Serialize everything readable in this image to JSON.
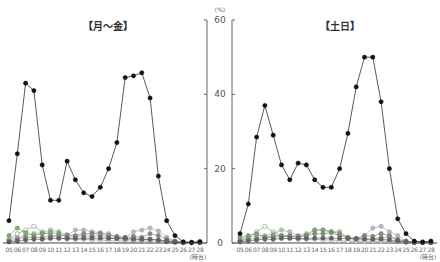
{
  "chart_data": [
    {
      "type": "line",
      "title": "【月～金】",
      "xlabel": "(時台)",
      "ylabel": "(%)",
      "ylim": [
        0,
        60
      ],
      "yticks": [
        0,
        20,
        40,
        60
      ],
      "grid": false,
      "categories": [
        "05",
        "06",
        "07",
        "08",
        "09",
        "10",
        "11",
        "12",
        "13",
        "14",
        "15",
        "16",
        "17",
        "18",
        "19",
        "20",
        "21",
        "22",
        "23",
        "24",
        "25",
        "26",
        "27",
        "28"
      ],
      "series": [
        {
          "name": "main",
          "color": "#111111",
          "fill": "#111111",
          "values": [
            6,
            24,
            43,
            41,
            21,
            11.5,
            11.5,
            22,
            17,
            13.5,
            12.5,
            15,
            20,
            27,
            44.5,
            45,
            45.8,
            39,
            18,
            6,
            2,
            0.3,
            0.2,
            0.4
          ]
        },
        {
          "name": "open-circle",
          "color": "#888888",
          "fill": "#ffffff",
          "values": [
            1,
            2.5,
            3.5,
            4.5,
            3,
            2,
            1.5,
            1,
            1,
            1,
            0.8,
            0.8,
            0.6,
            0.5,
            0.5,
            0.5,
            0.5,
            0.5,
            0.5,
            0.3,
            0.2,
            0.1,
            0.1,
            0.1
          ]
        },
        {
          "name": "light-gray",
          "color": "#999999",
          "fill": "#bbbbbb",
          "values": [
            1,
            1.5,
            2,
            2.5,
            2.8,
            3.5,
            3,
            2,
            3.5,
            3.5,
            3,
            2.8,
            2.5,
            1.5,
            1.5,
            3,
            3.5,
            4,
            3.2,
            1.5,
            0.5,
            0.2,
            0.1,
            0.1
          ]
        },
        {
          "name": "green",
          "color": "#5a9a4a",
          "fill": "#7ab06a",
          "values": [
            2,
            4,
            2.8,
            2,
            2.5,
            2.8,
            2.5,
            1.5,
            1.8,
            2,
            1.8,
            2,
            1.5,
            1.2,
            1,
            1.2,
            1,
            1,
            0.8,
            0.5,
            0.2,
            0.1,
            0.1,
            0.1
          ]
        },
        {
          "name": "mid-gray",
          "color": "#777777",
          "fill": "#8a8a8a",
          "values": [
            0.5,
            1,
            1.5,
            1.5,
            1.5,
            1.8,
            2,
            2.2,
            2,
            2.5,
            2.5,
            2.5,
            2,
            1.8,
            1.5,
            1.8,
            1.5,
            2.5,
            2,
            1,
            0.5,
            0.2,
            0.1,
            0.1
          ]
        },
        {
          "name": "dark-gray",
          "color": "#555555",
          "fill": "#666666",
          "values": [
            0.3,
            0.5,
            0.8,
            1,
            1,
            1.2,
            1.2,
            1.2,
            1.2,
            1.3,
            1.3,
            1.3,
            1.2,
            1.2,
            1.2,
            1,
            1,
            1,
            0.8,
            0.5,
            0.3,
            0.1,
            0.1,
            0.1
          ]
        }
      ]
    },
    {
      "type": "line",
      "title": "【土日】",
      "xlabel": "(時台)",
      "ylabel": "(%)",
      "ylim": [
        0,
        60
      ],
      "yticks": [
        0,
        20,
        40,
        60
      ],
      "grid": false,
      "categories": [
        "05",
        "06",
        "07",
        "08",
        "09",
        "10",
        "11",
        "12",
        "13",
        "14",
        "15",
        "16",
        "17",
        "18",
        "19",
        "20",
        "21",
        "22",
        "23",
        "24",
        "25",
        "26",
        "27",
        "28"
      ],
      "series": [
        {
          "name": "main",
          "color": "#111111",
          "fill": "#111111",
          "values": [
            2.5,
            10.5,
            28.5,
            37,
            29,
            21,
            17,
            21.5,
            21,
            17,
            15,
            15,
            20,
            29.5,
            42,
            50,
            50,
            38,
            20,
            6.5,
            2.5,
            0.5,
            0.3,
            0.5
          ]
        },
        {
          "name": "open-circle",
          "color": "#888888",
          "fill": "#ffffff",
          "values": [
            0.5,
            1.5,
            3,
            4.5,
            3,
            2,
            1.5,
            1,
            1,
            1,
            0.8,
            0.8,
            0.6,
            0.5,
            0.5,
            0.5,
            0.5,
            0.5,
            0.5,
            0.3,
            0.2,
            0.1,
            0.1,
            0.1
          ]
        },
        {
          "name": "light-gray",
          "color": "#999999",
          "fill": "#bbbbbb",
          "values": [
            1,
            1.5,
            2,
            2,
            2.5,
            3.5,
            3,
            2,
            2.5,
            3.5,
            3.5,
            3,
            3,
            1.5,
            1,
            2,
            4,
            4.5,
            3,
            2,
            0.5,
            0.2,
            0.1,
            0.1
          ]
        },
        {
          "name": "green",
          "color": "#5a9a4a",
          "fill": "#7ab06a",
          "values": [
            1.5,
            2,
            2.5,
            1.5,
            2,
            2,
            1.8,
            1.5,
            2,
            3.5,
            3.5,
            3,
            2.5,
            1.2,
            1,
            1.2,
            1,
            1.5,
            1.5,
            0.8,
            0.3,
            0.1,
            0.1,
            0.1
          ]
        },
        {
          "name": "mid-gray",
          "color": "#777777",
          "fill": "#8a8a8a",
          "values": [
            0.5,
            1,
            1.2,
            1.5,
            1.5,
            1.8,
            2,
            1.8,
            2,
            2.5,
            2.5,
            2.8,
            2,
            1.5,
            1.2,
            2,
            1.8,
            2.5,
            2,
            1,
            0.5,
            0.2,
            0.1,
            0.1
          ]
        },
        {
          "name": "dark-gray",
          "color": "#555555",
          "fill": "#666666",
          "values": [
            0.3,
            0.5,
            0.8,
            1,
            1,
            1.2,
            1.2,
            1.2,
            1.2,
            1.3,
            1.3,
            1.3,
            1.2,
            1.2,
            1.2,
            1,
            1,
            1,
            0.8,
            0.5,
            0.3,
            0.1,
            0.1,
            0.1
          ]
        }
      ]
    }
  ],
  "labels": {
    "left_title": "【月～金】",
    "right_title": "【土日】",
    "y_unit": "(%)",
    "x_unit": "(時台)",
    "yticks": [
      "0",
      "20",
      "40",
      "60"
    ]
  },
  "layout": {
    "y0_px": 243,
    "y60_px": 20,
    "left_x0": 9,
    "left_step": 8.3,
    "right_x0": 240,
    "right_step": 8.3,
    "left_axis_x": 207,
    "right_axis_x": 232,
    "ylabel_x": 220
  }
}
